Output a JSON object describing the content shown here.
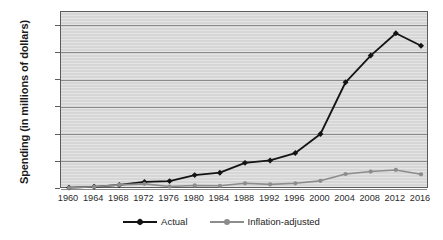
{
  "chart_data": {
    "type": "line",
    "title": "",
    "xlabel": "",
    "ylabel": "Spending (in millions of dollars)",
    "categories": [
      "1960",
      "1964",
      "1968",
      "1972",
      "1976",
      "1980",
      "1984",
      "1988",
      "1992",
      "1996",
      "2000",
      "2004",
      "2008",
      "2012",
      "2016"
    ],
    "x": [
      1960,
      1964,
      1968,
      1972,
      1976,
      1980,
      1984,
      1988,
      1992,
      1996,
      2000,
      2004,
      2008,
      2012,
      2016
    ],
    "ylim": [
      0,
      3250
    ],
    "yticks": [
      0,
      500,
      1000,
      1500,
      2000,
      2500,
      3000
    ],
    "ytick_labels": [
      "0",
      "500",
      "1000",
      "1500",
      "2000",
      "2500",
      "3000"
    ],
    "grid": true,
    "legend_position": "bottom",
    "series": [
      {
        "name": "Actual",
        "color": "#141414",
        "marker": "diamond",
        "values": [
          25,
          40,
          75,
          130,
          145,
          255,
          300,
          480,
          525,
          660,
          1010,
          1960,
          2450,
          2860,
          2630
        ]
      },
      {
        "name": "Inflation-adjusted",
        "color": "#8c8c8c",
        "marker": "circle",
        "values": [
          20,
          40,
          75,
          95,
          45,
          65,
          60,
          105,
          85,
          105,
          150,
          275,
          320,
          350,
          270
        ]
      }
    ]
  },
  "legend": {
    "items": [
      {
        "label": "Actual",
        "color": "#141414"
      },
      {
        "label": "Inflation-adjusted",
        "color": "#8c8c8c"
      }
    ]
  },
  "artifacts": {
    "left_smudge": "",
    "right_smudge": ""
  }
}
